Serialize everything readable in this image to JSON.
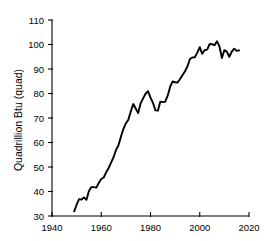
{
  "chart_data": {
    "type": "line",
    "title": "",
    "subtitle": "",
    "xlabel": "",
    "ylabel": "Quadrillion Btu (quad)",
    "xlim": [
      1940,
      2020
    ],
    "ylim": [
      30,
      110
    ],
    "xticks": [
      1940,
      1960,
      1980,
      2000,
      2020
    ],
    "xticklabels": [
      "1940",
      "1960",
      "1980",
      "2000",
      "2020"
    ],
    "yticks": [
      30,
      40,
      50,
      60,
      70,
      80,
      90,
      100,
      110
    ],
    "yticklabels": [
      "30",
      "40",
      "50",
      "60",
      "70",
      "80",
      "90",
      "100",
      "110"
    ],
    "grid": false,
    "legend": false,
    "legend_position": "none",
    "line_color": "#000000",
    "background_color": "#ffffff",
    "series": [
      {
        "name": "Total primary energy consumption",
        "x": [
          1949,
          1950,
          1951,
          1952,
          1953,
          1954,
          1955,
          1956,
          1957,
          1958,
          1959,
          1960,
          1961,
          1962,
          1963,
          1964,
          1965,
          1966,
          1967,
          1968,
          1969,
          1970,
          1971,
          1972,
          1973,
          1974,
          1975,
          1976,
          1977,
          1978,
          1979,
          1980,
          1981,
          1982,
          1983,
          1984,
          1985,
          1986,
          1987,
          1988,
          1989,
          1990,
          1991,
          1992,
          1993,
          1994,
          1995,
          1996,
          1997,
          1998,
          1999,
          2000,
          2001,
          2002,
          2003,
          2004,
          2005,
          2006,
          2007,
          2008,
          2009,
          2010,
          2011,
          2012,
          2013,
          2014,
          2015,
          2016
        ],
        "values": [
          31.9,
          34.6,
          36.9,
          36.7,
          37.6,
          36.6,
          40.2,
          41.8,
          41.8,
          41.6,
          43.5,
          45.1,
          45.7,
          47.8,
          49.6,
          51.8,
          54.0,
          57.0,
          58.9,
          62.4,
          65.6,
          67.8,
          69.3,
          72.7,
          75.7,
          73.9,
          72.0,
          76.0,
          78.0,
          79.9,
          80.9,
          78.3,
          76.2,
          73.1,
          73.0,
          76.7,
          76.5,
          76.7,
          79.2,
          82.8,
          84.9,
          84.6,
          84.5,
          85.9,
          87.5,
          89.1,
          91.0,
          94.1,
          94.7,
          94.8,
          96.7,
          98.9,
          96.2,
          97.7,
          97.9,
          100.2,
          100.1,
          99.7,
          101.3,
          99.2,
          94.5,
          97.7,
          97.1,
          95.0,
          97.1,
          98.3,
          97.4,
          97.6
        ]
      }
    ]
  },
  "axes": {
    "y_title": "Quadrillion Btu (quad)"
  }
}
